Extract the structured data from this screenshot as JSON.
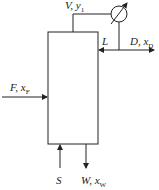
{
  "diagram": {
    "type": "distillation-column-with-condenser",
    "labels": {
      "vapor": {
        "main": "V, y",
        "sub": "1"
      },
      "reflux": {
        "main": "L"
      },
      "distillate": {
        "main": "D, x",
        "sub": "D"
      },
      "feed": {
        "main": "F, x",
        "sub": "F"
      },
      "steam": {
        "main": "S"
      },
      "bottoms": {
        "main": "W, x",
        "sub": "W"
      }
    },
    "colors": {
      "line": "#222222",
      "background": "#ffffff"
    }
  }
}
